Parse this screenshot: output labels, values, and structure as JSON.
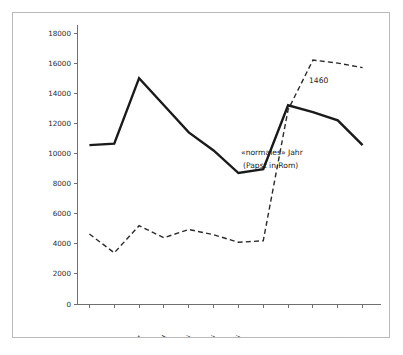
{
  "chart_data": {
    "type": "line",
    "title": "",
    "xlabel": "",
    "ylabel": "",
    "categories": [
      "Jan.",
      "Feb.",
      "März",
      "April",
      "Mai",
      "Juni",
      "Juli",
      "Aug.",
      "Sept.",
      "Okt.",
      "Nov.",
      "Dez."
    ],
    "ylim": [
      0,
      18000
    ],
    "yticks": [
      0,
      2000,
      4000,
      6000,
      8000,
      10000,
      12000,
      14000,
      16000,
      18000
    ],
    "ytick_labels": [
      "0",
      "2000",
      "4000",
      "6000",
      "8000",
      "10000",
      "12000",
      "14000",
      "16000",
      "18000"
    ],
    "grid": false,
    "legend_position": "inline-annotation",
    "series": [
      {
        "name": "«normales» Jahr (Papst in Rom)",
        "style": "solid",
        "values": [
          10550,
          10650,
          15000,
          13200,
          11400,
          10200,
          8700,
          8950,
          13200,
          12750,
          12200,
          10550
        ]
      },
      {
        "name": "1460",
        "style": "dashed",
        "values": [
          4650,
          3400,
          5200,
          4400,
          4950,
          4600,
          4100,
          4200,
          12900,
          16200,
          16000,
          15700
        ]
      }
    ],
    "annotations": [
      {
        "name": "dashed-series-label",
        "text": "1460"
      },
      {
        "name": "solid-series-label-line1",
        "text": "«normales» Jahr"
      },
      {
        "name": "solid-series-label-line2",
        "text": "(Papst in Rom)"
      }
    ],
    "colors": {
      "solid_series": "#1a1a1a",
      "dashed_series": "#2a2a2a",
      "axis": "#6f6f6f",
      "frame": "#b9b9b9",
      "background": "#ffffff"
    }
  }
}
